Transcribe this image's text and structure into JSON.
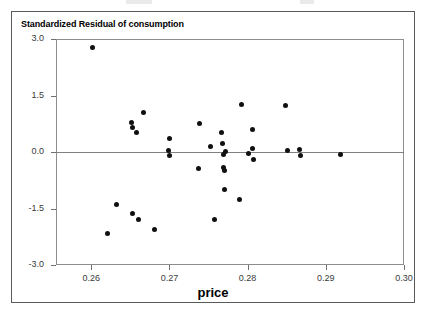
{
  "chart": {
    "title": "Standardized Residual of consumption",
    "xlabel": "price"
  },
  "axes": {
    "y_ticks": [
      "3.0",
      "1.5",
      "0.0",
      "-1.5",
      "-3.0"
    ],
    "x_ticks": [
      "0.26",
      "0.27",
      "0.28",
      "0.29",
      "0.30"
    ]
  },
  "chart_data": {
    "type": "scatter",
    "title": "Standardized Residual of consumption",
    "subtitle": "",
    "xlabel": "price",
    "ylabel": "Standardized Residual of consumption",
    "xlim": [
      0.2555,
      0.3
    ],
    "ylim": [
      -3.0,
      3.0
    ],
    "xticks": [
      0.26,
      0.27,
      0.28,
      0.29,
      0.3
    ],
    "xticklabels": [
      "0.26",
      "0.27",
      "0.28",
      "0.29",
      "0.30"
    ],
    "yticks": [
      3.0,
      1.5,
      0.0,
      -1.5,
      -3.0
    ],
    "yticklabels": [
      "3.0",
      "1.5",
      "0.0",
      "-1.5",
      "-3.0"
    ],
    "grid": false,
    "legend": null,
    "reference_lines": [
      {
        "orientation": "horizontal",
        "value": 0.0,
        "color": "#808080"
      }
    ],
    "marker": {
      "shape": "circle",
      "filled": true,
      "color": "#101010",
      "size": 5
    },
    "series": [
      {
        "name": "Standardized residuals",
        "x": [
          0.2601,
          0.2621,
          0.2632,
          0.2651,
          0.2653,
          0.2653,
          0.2658,
          0.2661,
          0.2667,
          0.2681,
          0.2699,
          0.27,
          0.27,
          0.2737,
          0.2739,
          0.2753,
          0.2757,
          0.2766,
          0.2768,
          0.2769,
          0.2769,
          0.277,
          0.2771,
          0.2772,
          0.2789,
          0.2792,
          0.2801,
          0.2806,
          0.2806,
          0.2807,
          0.2849,
          0.2851,
          0.2866,
          0.2867,
          0.2919
        ],
        "y": [
          2.78,
          -2.15,
          -1.38,
          0.79,
          0.66,
          -1.62,
          0.52,
          -1.8,
          1.06,
          -2.05,
          0.04,
          0.36,
          -0.1,
          -0.44,
          0.75,
          0.15,
          -1.78,
          0.53,
          0.24,
          -0.06,
          -0.4,
          -0.5,
          -1.0,
          0.02,
          -1.25,
          1.25,
          -0.05,
          0.1,
          0.6,
          -0.2,
          1.24,
          0.05,
          0.07,
          -0.1,
          -0.06
        ]
      }
    ],
    "n_points": 35
  }
}
